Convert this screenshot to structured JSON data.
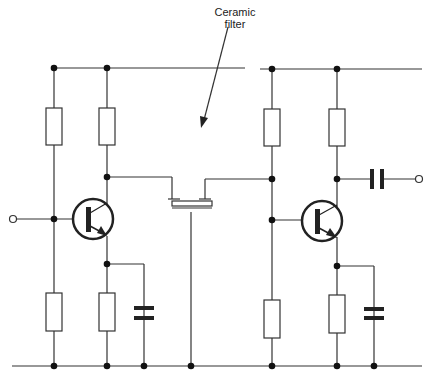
{
  "diagram": {
    "type": "circuit schematic",
    "annotation": {
      "line1": "Ceramic",
      "line2": "filter"
    },
    "colors": {
      "wire": "#333333",
      "background": "#ffffff",
      "component_fill": "#ffffff"
    },
    "components": [
      "input-terminal",
      "bias-resistor-top-1",
      "bias-resistor-bottom-1",
      "collector-resistor-1",
      "transistor-1",
      "emitter-resistor-1",
      "emitter-capacitor-1",
      "ceramic-filter",
      "bias-resistor-top-2",
      "bias-resistor-bottom-2",
      "collector-resistor-2",
      "transistor-2",
      "emitter-resistor-2",
      "emitter-capacitor-2",
      "output-capacitor",
      "output-terminal"
    ]
  }
}
